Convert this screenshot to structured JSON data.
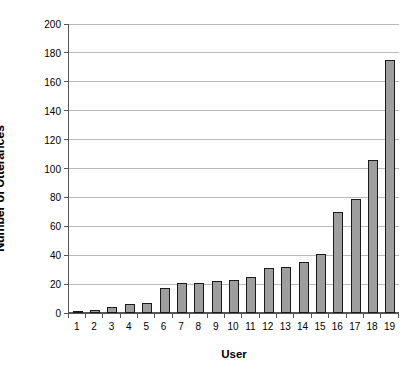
{
  "chart_data": {
    "type": "bar",
    "title": "",
    "xlabel": "User",
    "ylabel": "Number of Utterances",
    "categories": [
      "1",
      "2",
      "3",
      "4",
      "5",
      "6",
      "7",
      "8",
      "9",
      "10",
      "11",
      "12",
      "13",
      "14",
      "15",
      "16",
      "17",
      "18",
      "19"
    ],
    "values": [
      1,
      2,
      4,
      6,
      7,
      17,
      21,
      21,
      22,
      23,
      25,
      31,
      32,
      35,
      41,
      70,
      79,
      106,
      175
    ],
    "ylim": [
      0,
      200
    ],
    "yticks": [
      0,
      20,
      40,
      60,
      80,
      100,
      120,
      140,
      160,
      180,
      200
    ],
    "ytick_labels": [
      "0",
      "20",
      "40",
      "60",
      "80",
      "100",
      "120",
      "140",
      "160",
      "180",
      "200"
    ],
    "grid": true,
    "legend": false,
    "legend_position": "none",
    "bar_fill_color": "#9e9e9e",
    "bar_edge_color": "#1a1a1a",
    "gridline_color": "#b9babd",
    "axis_color": "#55565a",
    "background_color": "#ffffff"
  }
}
